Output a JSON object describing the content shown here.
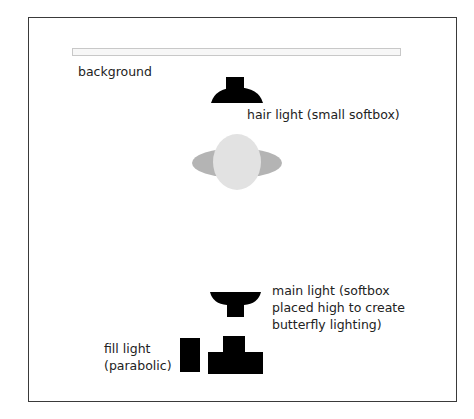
{
  "diagram": {
    "type": "lighting-setup",
    "labels": {
      "background": "background",
      "hair_light": "hair light (small softbox)",
      "main_light_1": "main light (softbox",
      "main_light_2": "placed high to create",
      "main_light_3": "butterfly lighting)",
      "fill_light_1": "fill light",
      "fill_light_2": "(parabolic)"
    },
    "colors": {
      "light_fill": "#000000",
      "subject_head": "#e2e2e2",
      "subject_shoulders": "#b4b4b4",
      "frame": "#3a3a3a"
    }
  }
}
